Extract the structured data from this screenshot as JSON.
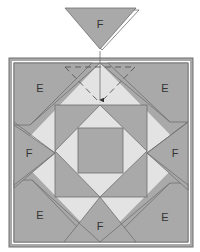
{
  "diagram": {
    "colors": {
      "dark_fill": "#a9a9a9",
      "light_fill": "#e3e3e3",
      "line": "#6e6e6e",
      "background": "#ffffff"
    },
    "floating_piece": {
      "label": "F"
    },
    "pieces": {
      "corner_top_left": "E",
      "corner_top_right": "E",
      "corner_bottom_left": "E",
      "corner_bottom_right": "E",
      "side_left": "F",
      "side_right": "F",
      "side_bottom": "F"
    }
  }
}
